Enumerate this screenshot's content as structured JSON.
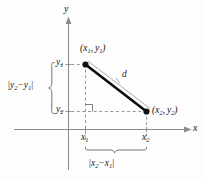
{
  "figure": {
    "background_color": "#fdfdfd",
    "axes": {
      "x_label": "x",
      "y_label": "y",
      "axis_color": "#8a8a8a"
    },
    "points": [
      {
        "id": "point-1",
        "label_open": "(",
        "label_x": "x",
        "label_x_sub": "1",
        "label_comma": ",",
        "label_y": "y",
        "label_y_sub": "1",
        "label_close": ")",
        "marker_color": "#111111"
      },
      {
        "id": "point-2",
        "label_open": "(",
        "label_x": "x",
        "label_x_sub": "2",
        "label_comma": ",",
        "label_y": "y",
        "label_y_sub": "2",
        "label_close": ")",
        "marker_color": "#111111"
      }
    ],
    "segment": {
      "distance_label": "d",
      "segment_color": "#0d0d0d",
      "leader_color": "#9a9a9a"
    },
    "ticks": {
      "x1": {
        "base": "x",
        "sub": "1"
      },
      "x2": {
        "base": "x",
        "sub": "2"
      },
      "y1": {
        "base": "y",
        "sub": "1"
      },
      "y2": {
        "base": "y",
        "sub": "2"
      }
    },
    "braces": {
      "vertical": {
        "bar_open": "|",
        "first": "y",
        "first_sub": "2",
        "operator": "−",
        "second": "y",
        "second_sub": "1",
        "bar_close": "|"
      },
      "horizontal": {
        "bar_open": "|",
        "first": "x",
        "first_sub": "2",
        "operator": "−",
        "second": "x",
        "second_sub": "1",
        "bar_close": "|"
      }
    },
    "guides": {
      "dash_color": "#8d8d8d",
      "right_angle_color": "#6f6f6f"
    }
  }
}
